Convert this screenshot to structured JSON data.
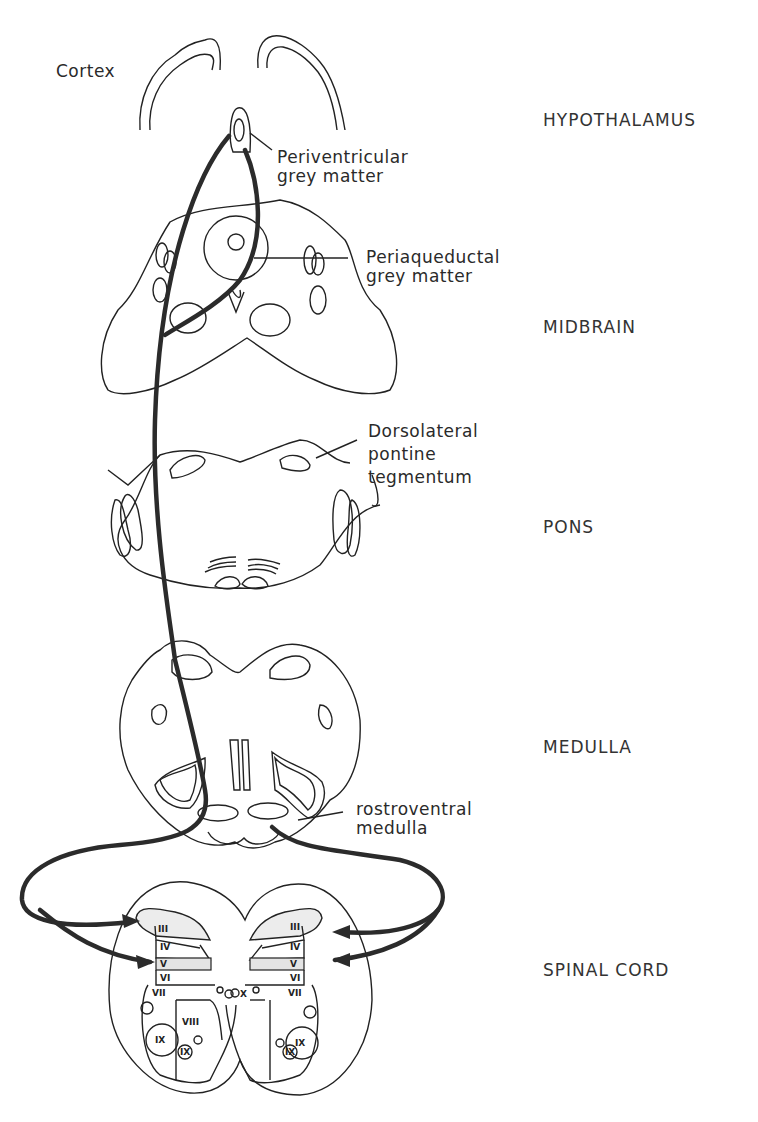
{
  "figure": {
    "structure_labels": {
      "cortex": "Cortex",
      "periventricular": "Periventricular\ngrey matter",
      "periaqueductal": "Periaqueductal\ngrey matter",
      "dorsolateral": "Dorsolateral\npontine\ntegmentum",
      "rostroventral": "rostroventral\nmedulla"
    },
    "regions": {
      "hypothalamus": "HYPOTHALAMUS",
      "midbrain": "MIDBRAIN",
      "pons": "PONS",
      "medulla": "MEDULLA",
      "spinal_cord": "SPINAL CORD"
    },
    "laminae": {
      "left": [
        "II",
        "III",
        "IV",
        "V",
        "VI",
        "VII",
        "VIII",
        "IX",
        "IX"
      ],
      "right": [
        "II",
        "III",
        "IV",
        "V",
        "VI",
        "VII",
        "IX",
        "IX"
      ],
      "center": "X"
    },
    "colors": {
      "line": "#222222",
      "pathway": "#2b2b2b",
      "background": "#ffffff"
    }
  }
}
